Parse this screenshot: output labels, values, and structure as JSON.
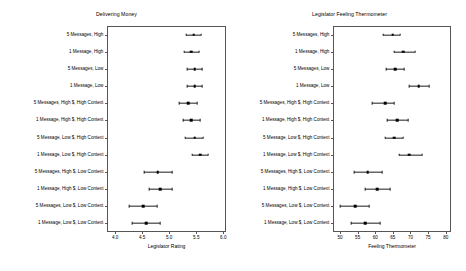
{
  "figure": {
    "width": 466,
    "height": 271,
    "background": "#ffffff",
    "series_color": "#000000"
  },
  "categories": [
    "5 Messages, High",
    "1 Message, High",
    "5 Messages, Low",
    "1 Message, Low",
    "5 Messages, High $, High Context",
    "1 Message,\nHigh $, High Context",
    "5 Message, Low $, High Context",
    "1 Message, Low $, High Context",
    "5 Messages, High $, Low Context",
    "1 Message, High $, Low Context",
    "5 Messages, Low $, Low Context",
    "1 Message, Low $, Low Context"
  ],
  "chart_data": [
    {
      "type": "scatter",
      "title": "Delivering Money",
      "xlabel": "Legislator Rating",
      "ylabel": "",
      "xlim": [
        3.85,
        6.05
      ],
      "xticks": [
        4.0,
        4.5,
        5.0,
        5.5,
        6.0
      ],
      "xticklabels": [
        "4.0",
        "4.5",
        "5.0",
        "5.5",
        "6.0"
      ],
      "grid": false,
      "orientation": "horizontal",
      "categories": [
        "5 Messages, High",
        "1 Message, High",
        "5 Messages, Low",
        "1 Message, Low",
        "5 Messages, High $, High Context",
        "1 Message, High $, High Context",
        "5 Message, Low $, High Context",
        "1 Message, Low $, High Context",
        "5 Messages, High $, Low Context",
        "1 Message, High $, Low Context",
        "5 Messages, Low $, Low Context",
        "1 Message, Low $, Low Context"
      ],
      "values": [
        5.45,
        5.41,
        5.47,
        5.47,
        5.35,
        5.41,
        5.47,
        5.57,
        4.79,
        4.83,
        4.52,
        4.57
      ],
      "ci_low": [
        5.31,
        5.28,
        5.33,
        5.33,
        5.19,
        5.25,
        5.3,
        5.42,
        4.53,
        4.62,
        4.25,
        4.32
      ],
      "ci_high": [
        5.59,
        5.55,
        5.61,
        5.61,
        5.51,
        5.57,
        5.63,
        5.72,
        5.05,
        5.05,
        4.78,
        4.83
      ]
    },
    {
      "type": "scatter",
      "title": "Legislator Feeling Thermometer",
      "xlabel": "Feeling Thermometer",
      "ylabel": "",
      "xlim": [
        48.0,
        81.5
      ],
      "xticks": [
        50,
        55,
        60,
        65,
        70,
        75,
        80
      ],
      "xticklabels": [
        "50",
        "55",
        "60",
        "65",
        "70",
        "75",
        "80"
      ],
      "grid": false,
      "orientation": "horizontal",
      "categories": [
        "5 Messages, High",
        "1 Message, High",
        "5 Messages, Low",
        "1 Message, Low",
        "5 Messages, High $, High Context",
        "1 Message, High $, High Context",
        "5 Message, Low $, High Context",
        "1 Message, Low $, High Context",
        "5 Messages, High $, Low Context",
        "1 Message, High $, Low Context",
        "5 Messages, Low $, Low Context",
        "1 Message, Low $, Low Context"
      ],
      "values": [
        65.0,
        68.0,
        65.6,
        72.3,
        62.8,
        66.2,
        65.4,
        69.7,
        57.9,
        60.6,
        54.3,
        57.2
      ],
      "ci_low": [
        62.2,
        65.3,
        63.0,
        69.6,
        59.2,
        63.4,
        62.8,
        66.8,
        54.1,
        57.1,
        50.0,
        53.2
      ],
      "ci_high": [
        67.0,
        71.2,
        68.2,
        75.2,
        65.2,
        69.3,
        68.0,
        73.2,
        62.0,
        64.1,
        58.2,
        61.3
      ]
    }
  ]
}
